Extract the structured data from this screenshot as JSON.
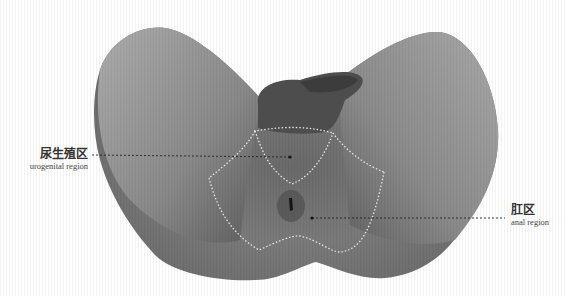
{
  "figure": {
    "colors": {
      "background": "#ffffff",
      "skin_light": "#a8a8a8",
      "skin_dark": "#5e5e5e",
      "genitalia": "#4d4d4d",
      "boundary_dots": "#e6e6e6",
      "leader_line": "#222222"
    }
  },
  "labels": [
    {
      "id": "urogenital",
      "zh": "尿生殖区",
      "en": "urogenital region"
    },
    {
      "id": "anal",
      "zh": "肛区",
      "en": "anal region"
    }
  ]
}
